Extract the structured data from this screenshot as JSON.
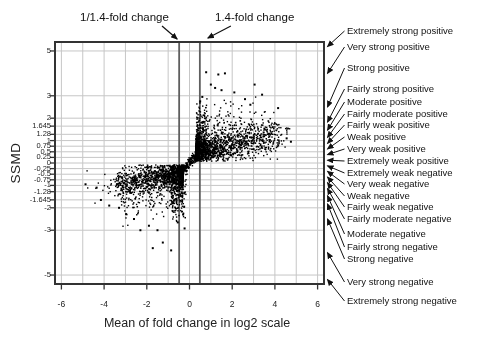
{
  "chart_data": {
    "type": "scatter",
    "title": "",
    "xlabel": "Mean of fold change in log2 scale",
    "ylabel": "SSMD",
    "xlim": [
      -6.3,
      6.3
    ],
    "ylim": [
      -5.4,
      5.4
    ],
    "x_ticks": [
      -6,
      -4,
      -2,
      0,
      2,
      4,
      6
    ],
    "y_ticks": [
      5,
      3,
      2,
      1.645,
      1.28,
      1,
      0.75,
      0.5,
      0.25,
      0,
      -0.25,
      -0.5,
      -0.75,
      -1,
      -1.28,
      -1.645,
      -2,
      -3,
      -5
    ],
    "x_grid_values": [
      -6,
      -5,
      -4,
      -3,
      -2,
      -1,
      0,
      1,
      2,
      3,
      4,
      5,
      6
    ],
    "grid": true,
    "fold_change_lines": {
      "left": {
        "x": -0.485,
        "label": "1/1.4-fold change"
      },
      "right": {
        "x": 0.485,
        "label": "1.4-fold change"
      }
    },
    "ssmd_categories": [
      {
        "label": "Extremely strong positive",
        "band": [
          5,
          99
        ],
        "label_y": 31
      },
      {
        "label": "Very strong positive",
        "band": [
          3,
          5
        ],
        "label_y": 47
      },
      {
        "label": "Strong positive",
        "band": [
          2,
          3
        ],
        "label_y": 68
      },
      {
        "label": "Fairly strong positive",
        "band": [
          1.645,
          2
        ],
        "label_y": 89
      },
      {
        "label": "Moderate positive",
        "band": [
          1.28,
          1.645
        ],
        "label_y": 102
      },
      {
        "label": "Fairly moderate positive",
        "band": [
          1,
          1.28
        ],
        "label_y": 114
      },
      {
        "label": "Fairly weak positive",
        "band": [
          0.75,
          1
        ],
        "label_y": 125
      },
      {
        "label": "Weak positive",
        "band": [
          0.5,
          0.75
        ],
        "label_y": 137
      },
      {
        "label": "Very weak positive",
        "band": [
          0.25,
          0.5
        ],
        "label_y": 149
      },
      {
        "label": "Extremely weak positive",
        "band": [
          0,
          0.25
        ],
        "label_y": 161
      },
      {
        "label": "Extremely weak negative",
        "band": [
          -0.25,
          0
        ],
        "label_y": 173
      },
      {
        "label": "Very weak negative",
        "band": [
          -0.5,
          -0.25
        ],
        "label_y": 184
      },
      {
        "label": "Weak negative",
        "band": [
          -0.75,
          -0.5
        ],
        "label_y": 196
      },
      {
        "label": "Fairly weak negative",
        "band": [
          -1,
          -0.75
        ],
        "label_y": 207
      },
      {
        "label": "Fairly moderate negative",
        "band": [
          -1.28,
          -1
        ],
        "label_y": 219
      },
      {
        "label": "Moderate negative",
        "band": [
          -1.645,
          -1.28
        ],
        "label_y": 234
      },
      {
        "label": "Fairly strong negative",
        "band": [
          -2,
          -1.645
        ],
        "label_y": 247
      },
      {
        "label": "Strong negative",
        "band": [
          -3,
          -2
        ],
        "label_y": 259
      },
      {
        "label": "Very strong negative",
        "band": [
          -5,
          -3
        ],
        "label_y": 282
      },
      {
        "label": "Extremely strong negative",
        "band": [
          -99,
          -5
        ],
        "label_y": 301
      }
    ],
    "scatter": {
      "seed": 20081214,
      "point_size": 1.4,
      "clusters": [
        {
          "name": "positive-main",
          "n": 1550,
          "x_from": 0.3,
          "x_to": 4.2,
          "x_bias": 2.6,
          "y_base": 0.4,
          "y_slope": 0.2,
          "sigma": 0.3,
          "sigma_slope": 0.03,
          "y_clamp": [
            0.08,
            2.6
          ]
        },
        {
          "name": "positive-near-threshold-column",
          "n": 260,
          "x_from": 0.33,
          "x_to": 0.8,
          "x_bias": 1.5,
          "y_base": 1.0,
          "y_slope": 0,
          "sigma": 0.72,
          "sigma_slope": 0,
          "y_clamp": [
            0.12,
            2.85
          ]
        },
        {
          "name": "positive-upper-halo",
          "n": 110,
          "x_from": 0.7,
          "x_to": 3.6,
          "x_bias": 1.7,
          "y_base": 1.8,
          "y_slope": 0.05,
          "sigma": 0.5,
          "sigma_slope": 0,
          "y_clamp": [
            1.1,
            3.1
          ]
        },
        {
          "name": "positive-far-right",
          "n": 40,
          "x_from": 3.3,
          "x_to": 4.75,
          "x_bias": 1.4,
          "y_base": 0.55,
          "y_slope": 0.12,
          "sigma": 0.28,
          "sigma_slope": 0,
          "y_clamp": [
            0.3,
            2.1
          ]
        },
        {
          "name": "negative-main",
          "n": 1450,
          "x_from": -0.3,
          "x_to": -3.4,
          "x_bias": 2.6,
          "y_base": -0.38,
          "y_slope": 0.18,
          "sigma": 0.3,
          "sigma_slope": 0.03,
          "y_clamp": [
            -2.6,
            -0.08
          ]
        },
        {
          "name": "negative-near-threshold-column",
          "n": 210,
          "x_from": -0.33,
          "x_to": -0.85,
          "x_bias": 1.5,
          "y_base": -0.95,
          "y_slope": 0,
          "sigma": 0.68,
          "sigma_slope": 0,
          "y_clamp": [
            -2.7,
            -0.12
          ]
        },
        {
          "name": "negative-lower-halo",
          "n": 120,
          "x_from": -0.6,
          "x_to": -3.2,
          "x_bias": 1.7,
          "y_base": -1.55,
          "y_slope": 0.08,
          "sigma": 0.45,
          "sigma_slope": 0,
          "y_clamp": [
            -2.85,
            -0.95
          ]
        },
        {
          "name": "negative-far-left",
          "n": 30,
          "x_from": -3.3,
          "x_to": -4.9,
          "x_bias": 1.4,
          "y_base": -0.3,
          "y_slope": 0.2,
          "sigma": 0.3,
          "sigma_slope": 0,
          "y_clamp": [
            -2.1,
            -0.25
          ]
        },
        {
          "name": "center-pinch",
          "n": 170,
          "x_from": -0.33,
          "x_to": 0.33,
          "x_bias": 1,
          "y_base": 0,
          "y_slope": 1.1,
          "sigma": 0.12,
          "sigma_slope": 0,
          "y_clamp": [
            -0.55,
            0.55
          ]
        },
        {
          "name": "below-center-string",
          "n": 22,
          "x_from": -0.12,
          "x_to": -0.35,
          "x_bias": 1,
          "y_base": -1.5,
          "y_slope": 0,
          "sigma": 0.75,
          "sigma_slope": 0,
          "y_clamp": [
            -2.85,
            -0.35
          ]
        }
      ],
      "outliers": [
        [
          0.78,
          4.05
        ],
        [
          1.35,
          3.95
        ],
        [
          1.66,
          4.0
        ],
        [
          1.0,
          3.5
        ],
        [
          1.2,
          3.35
        ],
        [
          1.5,
          3.25
        ],
        [
          2.1,
          3.15
        ],
        [
          3.05,
          3.5
        ],
        [
          3.4,
          3.05
        ],
        [
          2.6,
          2.85
        ],
        [
          2.85,
          2.6
        ],
        [
          0.6,
          2.95
        ],
        [
          0.5,
          2.75
        ],
        [
          4.15,
          2.45
        ],
        [
          3.9,
          1.6
        ],
        [
          4.55,
          1.1
        ],
        [
          4.75,
          0.95
        ],
        [
          -1.72,
          -3.8
        ],
        [
          -1.25,
          -3.55
        ],
        [
          -0.86,
          -3.9
        ],
        [
          -0.55,
          -2.65
        ],
        [
          -0.23,
          -2.92
        ],
        [
          -2.3,
          -3.0
        ],
        [
          -2.97,
          -2.28
        ],
        [
          -3.76,
          -1.9
        ],
        [
          -4.15,
          -1.65
        ],
        [
          -4.35,
          -1.1
        ],
        [
          -4.87,
          -0.95
        ],
        [
          -0.3,
          -2.3
        ],
        [
          -0.25,
          -1.95
        ],
        [
          -2.6,
          -2.5
        ],
        [
          -1.9,
          -2.8
        ],
        [
          -1.5,
          -3.0
        ],
        [
          -3.3,
          -2.0
        ]
      ]
    },
    "colors": {
      "points": "#000000",
      "grid": "#c6c6c6",
      "threshold_lines": "#5f5f5f",
      "frame": "#333333",
      "text": "#111111"
    },
    "legend": null
  }
}
